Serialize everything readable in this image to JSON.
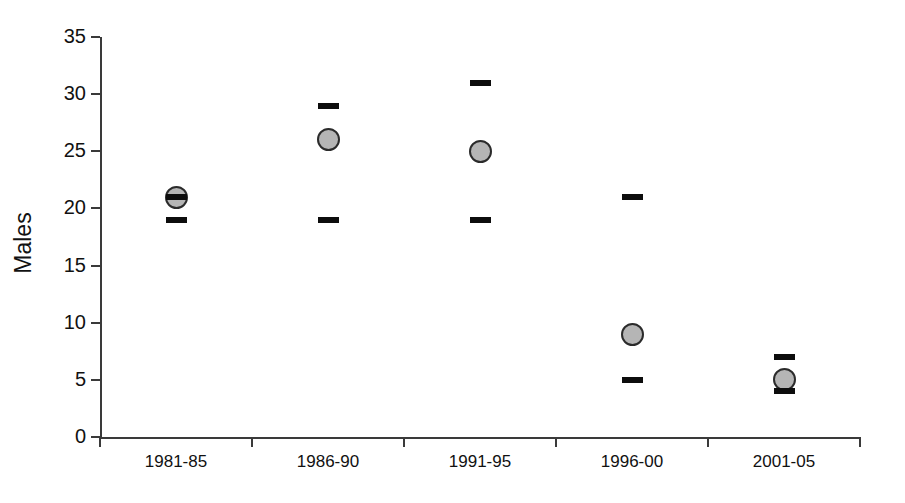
{
  "chart_data": {
    "type": "scatter",
    "title": "",
    "subtitle": "",
    "xlabel": "",
    "ylabel": "Males",
    "categories": [
      "1981-85",
      "1986-90",
      "1991-95",
      "1996-00",
      "2001-05"
    ],
    "values": [
      21,
      26,
      25,
      9,
      5
    ],
    "upper": [
      21,
      29,
      31,
      21,
      7
    ],
    "lower": [
      19,
      19,
      19,
      5,
      4
    ],
    "series": [
      {
        "name": "Males",
        "values": [
          21,
          26,
          25,
          9,
          5
        ]
      },
      {
        "name": "Upper limit",
        "values": [
          21,
          29,
          31,
          21,
          7
        ]
      },
      {
        "name": "Lower limit",
        "values": [
          19,
          19,
          19,
          5,
          4
        ]
      }
    ],
    "ylim": [
      0,
      35
    ],
    "yticks": [
      0,
      5,
      10,
      15,
      20,
      25,
      30,
      35
    ],
    "ytick_labels": [
      "0",
      "5",
      "10",
      "15",
      "20",
      "25",
      "30",
      "35"
    ],
    "grid": false,
    "legend": "none",
    "marker_fill_color": "#b5b5b5",
    "marker_edge_color": "#2b2b2b",
    "cap_color": "#0d0d0d",
    "axis_color": "#3a3a3a"
  },
  "axis": {
    "y_label": "Males",
    "y_ticks": [
      {
        "label": "35",
        "value": 35
      },
      {
        "label": "30",
        "value": 30
      },
      {
        "label": "25",
        "value": 25
      },
      {
        "label": "20",
        "value": 20
      },
      {
        "label": "15",
        "value": 15
      },
      {
        "label": "10",
        "value": 10
      },
      {
        "label": "5",
        "value": 5
      },
      {
        "label": "0",
        "value": 0
      }
    ],
    "x_ticks": [
      {
        "label": "1981-85"
      },
      {
        "label": "1986-90"
      },
      {
        "label": "1991-95"
      },
      {
        "label": "1996-00"
      },
      {
        "label": "2001-05"
      }
    ]
  }
}
